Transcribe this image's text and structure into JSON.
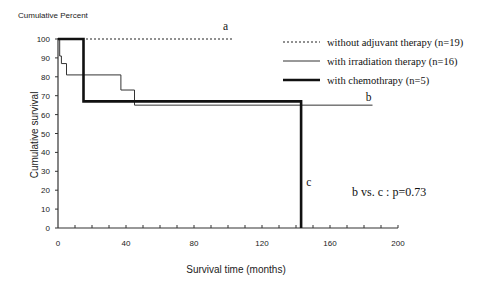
{
  "chart_data": {
    "type": "line",
    "subtype": "kaplan-meier-step",
    "title": "",
    "top_label": "Cumulative Percent",
    "xlabel": "Survival time (months)",
    "ylabel": "Cumulative survival",
    "xlim": [
      0,
      200
    ],
    "ylim": [
      0,
      100
    ],
    "x_ticks": [
      0,
      40,
      80,
      120,
      160,
      200
    ],
    "x_minor_tick_step": 10,
    "y_ticks": [
      0,
      10,
      20,
      30,
      40,
      50,
      60,
      70,
      80,
      90,
      100
    ],
    "grid": false,
    "legend_position": "upper right",
    "series": [
      {
        "name": "without adjuvant therapy (n=19)",
        "style": "dotted",
        "curve_label": "a",
        "points": [
          [
            0,
            100
          ],
          [
            103,
            100
          ]
        ]
      },
      {
        "name": "with irradiation therapy (n=16)",
        "style": "thin",
        "curve_label": "b",
        "points": [
          [
            0,
            100
          ],
          [
            1,
            91
          ],
          [
            2,
            87
          ],
          [
            5,
            81
          ],
          [
            37,
            73
          ],
          [
            45,
            65
          ],
          [
            185,
            65
          ]
        ]
      },
      {
        "name": "with chemothrapy (n=5)",
        "style": "thick",
        "curve_label": "c",
        "points": [
          [
            0,
            100
          ],
          [
            15,
            67
          ],
          [
            143,
            0
          ]
        ]
      }
    ],
    "annotations": [
      {
        "text": "a",
        "x": 97,
        "y": 105
      },
      {
        "text": "b",
        "x": 181,
        "y": 67
      },
      {
        "text": "c",
        "x": 146,
        "y": 22
      },
      {
        "text": "b vs. c : p=0.73",
        "x": 173,
        "y": 17
      }
    ]
  }
}
